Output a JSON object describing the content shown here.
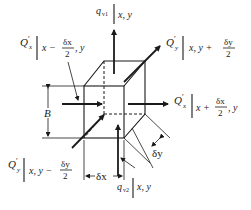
{
  "diagram": {
    "colors": {
      "ink": "#1a1a1a",
      "background": "#ffffff"
    },
    "labels": {
      "q_top": {
        "symbol": "q",
        "subscript": "v1",
        "eval": "x, y"
      },
      "q_bottom": {
        "symbol": "q",
        "subscript": "v2",
        "eval": "x, y"
      },
      "Qx_left": {
        "symbol": "Q",
        "prime": "′",
        "subscript": "x",
        "eval_pre": "x −",
        "frac_num": "δx",
        "frac_den": "2",
        "eval_post": ", y"
      },
      "Qx_right": {
        "symbol": "Q",
        "prime": "′",
        "subscript": "x",
        "eval_pre": "x +",
        "frac_num": "δx",
        "frac_den": "2",
        "eval_post": ", y"
      },
      "Qy_top": {
        "symbol": "Q",
        "prime": "′",
        "subscript": "y",
        "eval_pre": "x, y +",
        "frac_num": "δy",
        "frac_den": "2"
      },
      "Qy_bottom": {
        "symbol": "Q",
        "prime": "′",
        "subscript": "y",
        "eval_pre": "x, y −",
        "frac_num": "δy",
        "frac_den": "2"
      },
      "thickness": "B",
      "dx": "δx",
      "dy": "δy"
    }
  }
}
